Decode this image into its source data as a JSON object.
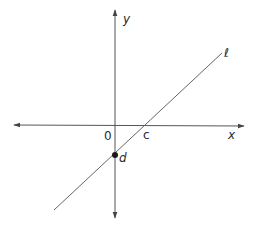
{
  "diagram": {
    "colors": {
      "axis": "#555555",
      "line": "#666666",
      "text": "#2a2a2a",
      "point": "#1a1a1a",
      "background": "#ffffff"
    },
    "axes": {
      "x_label": "x",
      "y_label": "y",
      "origin_label": "0"
    },
    "line": {
      "label": "ℓ"
    },
    "points": [
      {
        "id": "c",
        "label": "c",
        "description": "x-intercept of line ℓ",
        "marked": false
      },
      {
        "id": "d",
        "label": "d",
        "description": "y-intercept of line ℓ",
        "marked": true
      }
    ]
  }
}
